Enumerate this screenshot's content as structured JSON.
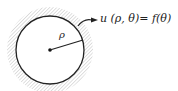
{
  "diagram": {
    "boundary_label": "u (ρ, θ)= f(θ)",
    "radius_label": "ρ",
    "colors": {
      "stroke": "#222222",
      "hatch": "#c8c8c8"
    }
  }
}
